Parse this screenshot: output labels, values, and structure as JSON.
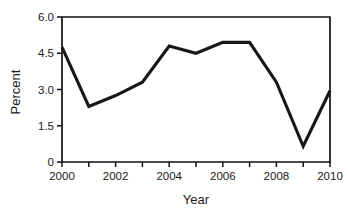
{
  "chart_data": {
    "type": "line",
    "title": "",
    "xlabel": "Year",
    "ylabel": "Percent",
    "x": [
      2000,
      2001,
      2002,
      2003,
      2004,
      2005,
      2006,
      2007,
      2008,
      2009,
      2010
    ],
    "values": [
      4.75,
      2.3,
      2.75,
      3.3,
      4.8,
      4.5,
      4.95,
      4.95,
      3.3,
      0.65,
      2.95
    ],
    "series": [
      {
        "name": "Percent",
        "values": [
          4.75,
          2.3,
          2.75,
          3.3,
          4.8,
          4.5,
          4.95,
          4.95,
          3.3,
          0.65,
          2.95
        ]
      }
    ],
    "xlim": [
      2000,
      2010
    ],
    "ylim": [
      0,
      6.0
    ],
    "grid": false,
    "legend": false,
    "line_color": "#171717",
    "xticks": [
      2000,
      2001,
      2002,
      2003,
      2004,
      2005,
      2006,
      2007,
      2008,
      2009,
      2010
    ],
    "xtick_labels": [
      "2000",
      "",
      "2002",
      "",
      "2004",
      "",
      "2006",
      "",
      "2008",
      "",
      "2010"
    ],
    "xtick_labels_shown": [
      "2000",
      "2002",
      "2004",
      "2006",
      "2008",
      "2010"
    ],
    "yticks": [
      0,
      1.5,
      3.0,
      4.5,
      6.0
    ],
    "ytick_labels": [
      "0",
      "1.5",
      "3.0",
      "4.5",
      "6.0"
    ]
  }
}
